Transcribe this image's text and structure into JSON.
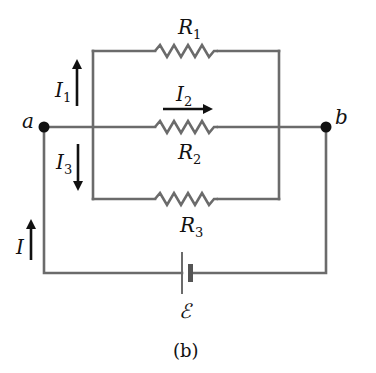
{
  "diagram": {
    "type": "circuit",
    "caption": "(b)",
    "nodes": [
      {
        "id": "a",
        "label": "a"
      },
      {
        "id": "b",
        "label": "b"
      }
    ],
    "resistors": [
      {
        "name": "R",
        "sub": "1"
      },
      {
        "name": "R",
        "sub": "2"
      },
      {
        "name": "R",
        "sub": "3"
      }
    ],
    "currents": [
      {
        "name": "I",
        "sub": "1",
        "direction": "up"
      },
      {
        "name": "I",
        "sub": "2",
        "direction": "right"
      },
      {
        "name": "I",
        "sub": "3",
        "direction": "down"
      },
      {
        "name": "I",
        "sub": "",
        "direction": "up"
      }
    ],
    "source": {
      "label": "ℰ"
    },
    "colors": {
      "wire": "#6b6b6b",
      "arrow": "#111111",
      "node": "#111111"
    }
  }
}
